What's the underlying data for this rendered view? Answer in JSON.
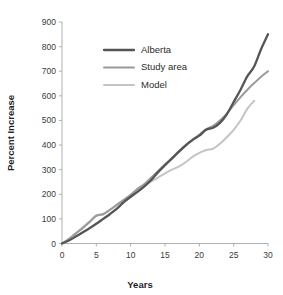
{
  "chart_data": {
    "type": "line",
    "title": "",
    "xlabel": "Years",
    "ylabel": "Percent Increase",
    "xlim": [
      0,
      30
    ],
    "ylim": [
      0,
      900
    ],
    "xticks": [
      0,
      5,
      10,
      15,
      20,
      25,
      30
    ],
    "yticks": [
      0,
      100,
      200,
      300,
      400,
      500,
      600,
      700,
      800,
      900
    ],
    "xtick_labels": [
      "0",
      "5",
      "10",
      "15",
      "20",
      "25",
      "30"
    ],
    "ytick_labels": [
      "0",
      "100",
      "200",
      "300",
      "400",
      "500",
      "600",
      "700",
      "800",
      "900"
    ],
    "grid": false,
    "legend_position": "upper-center-left",
    "series": [
      {
        "name": "Alberta",
        "color": "#555555",
        "width": 2.3,
        "x": [
          0,
          1,
          2,
          3,
          4,
          5,
          6,
          7,
          8,
          9,
          10,
          11,
          12,
          13,
          14,
          15,
          16,
          17,
          18,
          19,
          20,
          21,
          22,
          23,
          24,
          25,
          26,
          27,
          28,
          29,
          30
        ],
        "y": [
          0,
          12,
          28,
          45,
          62,
          80,
          100,
          120,
          142,
          168,
          190,
          210,
          232,
          258,
          290,
          318,
          345,
          372,
          398,
          420,
          438,
          462,
          470,
          490,
          525,
          575,
          625,
          680,
          720,
          790,
          850
        ]
      },
      {
        "name": "Study area",
        "color": "#9a9a9a",
        "width": 2.0,
        "x": [
          0,
          1,
          2,
          3,
          4,
          5,
          6,
          7,
          8,
          9,
          10,
          11,
          12,
          13,
          14,
          15,
          16,
          17,
          18,
          19,
          20,
          21,
          22,
          23,
          24,
          25,
          26,
          27,
          28,
          29,
          30
        ],
        "y": [
          0,
          18,
          40,
          62,
          86,
          112,
          120,
          138,
          158,
          178,
          198,
          222,
          242,
          268,
          295,
          322,
          348,
          375,
          400,
          422,
          442,
          465,
          478,
          500,
          528,
          562,
          595,
          625,
          652,
          678,
          700
        ]
      },
      {
        "name": "Model",
        "color": "#c4c4c4",
        "width": 2.0,
        "x": [
          0,
          1,
          2,
          3,
          4,
          5,
          6,
          7,
          8,
          9,
          10,
          11,
          12,
          13,
          14,
          15,
          16,
          17,
          18,
          19,
          20,
          21,
          22,
          23,
          24,
          25,
          26,
          27,
          28
        ],
        "y": [
          0,
          18,
          42,
          66,
          90,
          115,
          118,
          136,
          156,
          176,
          196,
          220,
          240,
          252,
          268,
          285,
          300,
          312,
          330,
          352,
          368,
          380,
          385,
          405,
          432,
          462,
          500,
          548,
          580
        ]
      }
    ]
  },
  "legend": {
    "items": [
      {
        "label": "Alberta",
        "color": "#555555"
      },
      {
        "label": "Study area",
        "color": "#9a9a9a"
      },
      {
        "label": "Model",
        "color": "#c4c4c4"
      }
    ]
  }
}
